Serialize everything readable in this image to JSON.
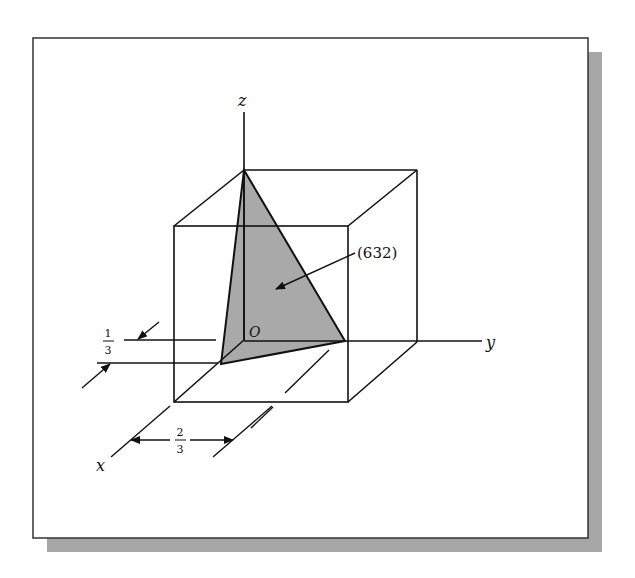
{
  "figure": {
    "plane_label": "(632)",
    "axes": {
      "x": "x",
      "y": "y",
      "z": "z"
    },
    "origin_label": "O",
    "dimension_x": {
      "num": "1",
      "den": "3"
    },
    "dimension_y": {
      "num": "2",
      "den": "3"
    },
    "colors": {
      "plane_fill": "#a9a9a9",
      "shadow": "#a6a6a6",
      "line": "#111111"
    }
  }
}
